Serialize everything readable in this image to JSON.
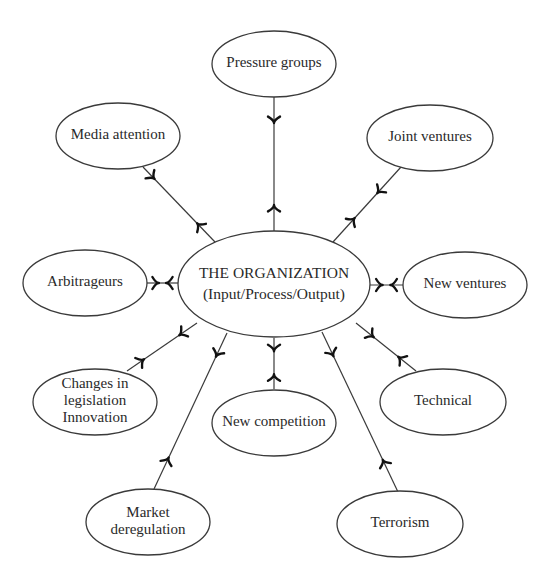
{
  "diagram": {
    "type": "hub-and-spoke influence diagram",
    "center": {
      "id": "organization",
      "lines": [
        "THE ORGANIZATION",
        "(Input/Process/Output)"
      ],
      "cx": 274,
      "cy": 284,
      "rx": 96,
      "ry": 53
    },
    "nodes": [
      {
        "id": "pressure-groups",
        "lines": [
          "Pressure groups"
        ],
        "cx": 274,
        "cy": 64,
        "rx": 62,
        "ry": 33
      },
      {
        "id": "media-attention",
        "lines": [
          "Media attention"
        ],
        "cx": 118,
        "cy": 136,
        "rx": 62,
        "ry": 33
      },
      {
        "id": "joint-ventures",
        "lines": [
          "Joint ventures"
        ],
        "cx": 430,
        "cy": 138,
        "rx": 63,
        "ry": 33
      },
      {
        "id": "arbitrageurs",
        "lines": [
          "Arbitrageurs"
        ],
        "cx": 85,
        "cy": 283,
        "rx": 62,
        "ry": 33
      },
      {
        "id": "new-ventures",
        "lines": [
          "New ventures"
        ],
        "cx": 465,
        "cy": 285,
        "rx": 62,
        "ry": 33
      },
      {
        "id": "changes-in-legislation-innovation",
        "lines": [
          "Changes in",
          "legislation",
          "Innovation"
        ],
        "cx": 95,
        "cy": 402,
        "rx": 62,
        "ry": 33
      },
      {
        "id": "new-competition",
        "lines": [
          "New competition"
        ],
        "cx": 274,
        "cy": 423,
        "rx": 62,
        "ry": 33
      },
      {
        "id": "technical",
        "lines": [
          "Technical"
        ],
        "cx": 443,
        "cy": 402,
        "rx": 63,
        "ry": 33
      },
      {
        "id": "market-deregulation",
        "lines": [
          "Market",
          "deregulation"
        ],
        "cx": 148,
        "cy": 522,
        "rx": 62,
        "ry": 33
      },
      {
        "id": "terrorism",
        "lines": [
          "Terrorism"
        ],
        "cx": 400,
        "cy": 524,
        "rx": 63,
        "ry": 33
      }
    ],
    "edges": [
      {
        "from": "pressure-groups",
        "x1": 274,
        "y1": 97,
        "x2": 274,
        "y2": 231,
        "a1": 0.18,
        "a2": 0.82
      },
      {
        "from": "media-attention",
        "x1": 143,
        "y1": 167,
        "x2": 215,
        "y2": 242,
        "a1": 0.14,
        "a2": 0.77
      },
      {
        "from": "joint-ventures",
        "x1": 401,
        "y1": 167,
        "x2": 333,
        "y2": 242,
        "a1": 0.33,
        "a2": 0.7
      },
      {
        "from": "arbitrageurs",
        "x1": 147,
        "y1": 283,
        "x2": 178,
        "y2": 283,
        "a1": 0.32,
        "a2": 0.68
      },
      {
        "from": "new-ventures",
        "x1": 403,
        "y1": 285,
        "x2": 370,
        "y2": 285,
        "a1": 0.32,
        "a2": 0.68
      },
      {
        "from": "changes-in-legislation-innovation",
        "x1": 127,
        "y1": 371,
        "x2": 197,
        "y2": 323,
        "a1": 0.22,
        "a2": 0.77
      },
      {
        "from": "market-deregulation",
        "x1": 154,
        "y1": 489,
        "x2": 227,
        "y2": 333,
        "a1": 0.19,
        "a2": 0.86
      },
      {
        "from": "new-competition",
        "x1": 274,
        "y1": 389,
        "x2": 274,
        "y2": 338,
        "a1": 0.25,
        "a2": 0.78
      },
      {
        "from": "technical",
        "x1": 416,
        "y1": 371,
        "x2": 356,
        "y2": 323,
        "a1": 0.27,
        "a2": 0.73
      },
      {
        "from": "terrorism",
        "x1": 398,
        "y1": 492,
        "x2": 322,
        "y2": 332,
        "a1": 0.19,
        "a2": 0.86
      }
    ],
    "colors": {
      "stroke": "#3a3a3a",
      "arrow": "#111111",
      "text": "#2a2a2a",
      "background": "#ffffff"
    }
  }
}
